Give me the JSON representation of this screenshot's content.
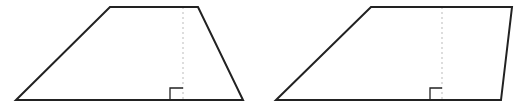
{
  "diagram": {
    "stroke_color": "#222222",
    "dotted_color": "#bbbbbb",
    "shapes": [
      {
        "name": "isosceles-like trapezoid",
        "points": [
          [
            16,
            100
          ],
          [
            110,
            7
          ],
          [
            198,
            7
          ],
          [
            243,
            100
          ]
        ],
        "height_line": {
          "x": 183,
          "y1": 7,
          "y2": 100
        },
        "right_angle": {
          "x": 170,
          "y": 88,
          "size": 13
        }
      },
      {
        "name": "slanted trapezoid",
        "points": [
          [
            276,
            100
          ],
          [
            371,
            7
          ],
          [
            512,
            7
          ],
          [
            501,
            100
          ]
        ],
        "height_line": {
          "x": 442,
          "y1": 7,
          "y2": 100
        },
        "right_angle": {
          "x": 430,
          "y": 88,
          "size": 12
        }
      }
    ]
  }
}
